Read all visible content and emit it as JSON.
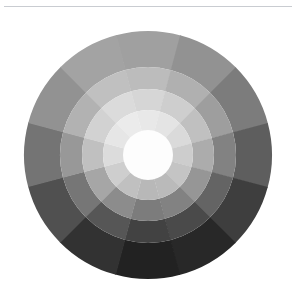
{
  "page": {
    "background_color": "#ffffff",
    "rule_color": "#c9ccd1"
  },
  "figure": {
    "name": "grayscale-color-wheel",
    "center_x": 148,
    "center_y": 147,
    "outer_radius": 124,
    "hub_radius": 25,
    "hub_color": "#fdfdfd",
    "segment_count": 12,
    "ring_count": 5,
    "start_angle_deg": -105
  },
  "chart_data": {
    "type": "pie",
    "title": "",
    "subtitle": "",
    "xlabel": "",
    "ylabel": "",
    "legend": [],
    "grid": false,
    "sector_labels": [
      "12 o'clock",
      "1 o'clock",
      "2 o'clock",
      "3 o'clock",
      "4 o'clock",
      "5 o'clock",
      "6 o'clock",
      "7 o'clock",
      "8 o'clock",
      "9 o'clock",
      "10 o'clock",
      "11 o'clock"
    ],
    "ring_labels": [
      "ring-1",
      "ring-2",
      "ring-3",
      "ring-4",
      "ring-5"
    ],
    "ring_radii": [
      25,
      45,
      66,
      88,
      124
    ],
    "series": [
      {
        "name": "ring-1",
        "values": [
          232,
          228,
          218,
          205,
          196,
          186,
          184,
          192,
          206,
          220,
          230,
          235
        ]
      },
      {
        "name": "ring-2",
        "values": [
          214,
          206,
          192,
          172,
          150,
          130,
          124,
          140,
          166,
          192,
          210,
          219
        ]
      },
      {
        "name": "ring-3",
        "values": [
          188,
          176,
          158,
          130,
          100,
          74,
          66,
          86,
          118,
          152,
          178,
          192
        ]
      },
      {
        "name": "ring-4",
        "values": [
          160,
          146,
          124,
          94,
          62,
          40,
          34,
          50,
          80,
          116,
          146,
          163
        ]
      },
      {
        "name": "ring-5",
        "values": [
          134,
          118,
          96,
          66,
          38,
          22,
          20,
          30,
          56,
          90,
          120,
          138
        ]
      }
    ],
    "min_value": 20,
    "max_value": 235
  }
}
